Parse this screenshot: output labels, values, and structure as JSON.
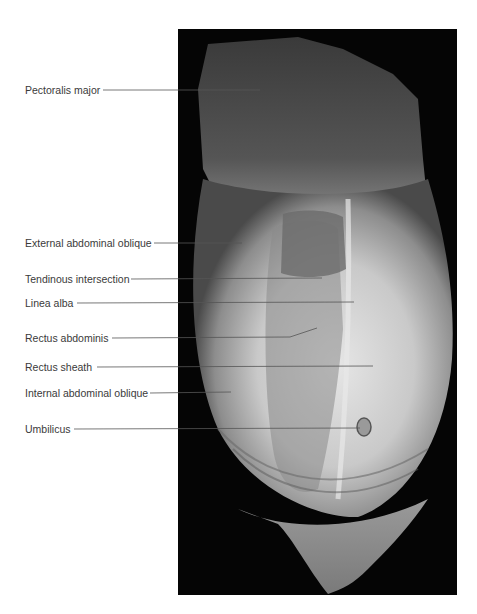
{
  "figure": {
    "type": "anatomical-photograph",
    "labels": [
      {
        "text": "Pectoralis major",
        "y": 90,
        "line_start": 103,
        "line_end": [
          260,
          90
        ]
      },
      {
        "text": "External abdominal oblique",
        "y": 243,
        "line_start": 154,
        "line_end": [
          242,
          243
        ]
      },
      {
        "text": "Tendinous intersection",
        "y": 279,
        "line_start": 131,
        "line_end": [
          322,
          278
        ]
      },
      {
        "text": "Linea alba",
        "y": 303,
        "line_start": 77,
        "line_end": [
          354,
          302
        ]
      },
      {
        "text": "Rectus abdominis",
        "y": 338,
        "line_start": 112,
        "line_end": [
          317,
          328
        ],
        "bend": [
          290,
          337
        ]
      },
      {
        "text": "Rectus sheath",
        "y": 367,
        "line_start": 97,
        "line_end": [
          373,
          366
        ]
      },
      {
        "text": "Internal abdominal oblique",
        "y": 393,
        "line_start": 150,
        "line_end": [
          231,
          392
        ]
      },
      {
        "text": "Umbilicus",
        "y": 429,
        "line_start": 74,
        "line_end": [
          360,
          428
        ]
      }
    ]
  }
}
